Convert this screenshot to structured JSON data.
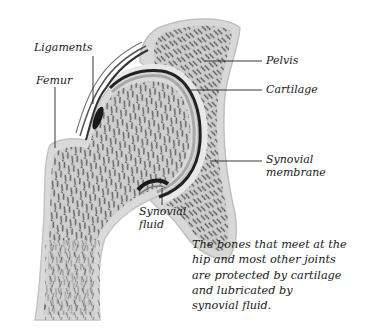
{
  "diagram": {
    "labels": {
      "ligaments": "Ligaments",
      "femur": "Femur",
      "pelvis": "Pelvis",
      "cartilage": "Cartilage",
      "synovial_membrane_line1": "Synovial",
      "synovial_membrane_line2": "membrane",
      "synovial_fluid_line1": "Synovial",
      "synovial_fluid_line2": "fluid"
    },
    "caption": {
      "lines": [
        "The bones that meet at the",
        "hip and most other joints",
        "are protected by cartilage",
        "and lubricated by",
        "synovial fluid."
      ]
    },
    "colors": {
      "bone_fill": "#d9d9d9",
      "bone_outline": "#bdbdbd",
      "spongy_bone": "#8a8a8a",
      "cartilage": "#c8c8c8",
      "ligament_dark": "#2a2a2a",
      "leader_line": "#222222"
    }
  }
}
